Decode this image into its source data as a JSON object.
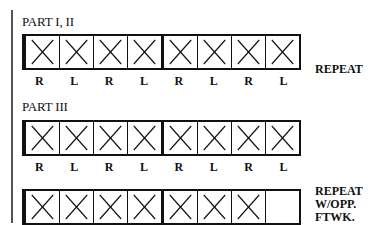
{
  "diagram": {
    "sections": [
      {
        "label": "PART I, II",
        "cells": [
          "X",
          "X",
          "X",
          "X",
          "X",
          "X",
          "X",
          "X"
        ],
        "footwork": [
          "R",
          "L",
          "R",
          "L",
          "R",
          "L",
          "R",
          "L"
        ],
        "note": "REPEAT"
      },
      {
        "label": "PART III",
        "cells": [
          "X",
          "X",
          "X",
          "X",
          "X",
          "X",
          "X",
          "X"
        ],
        "footwork": [
          "R",
          "L",
          "R",
          "L",
          "R",
          "L",
          "R",
          "L"
        ],
        "note": ""
      },
      {
        "label": "",
        "cells": [
          "X",
          "X",
          "X",
          "X",
          "X",
          "X",
          "X",
          ""
        ],
        "footwork": [],
        "note_lines": [
          "REPEAT",
          "W/OPP.",
          "FTWK."
        ]
      }
    ]
  }
}
